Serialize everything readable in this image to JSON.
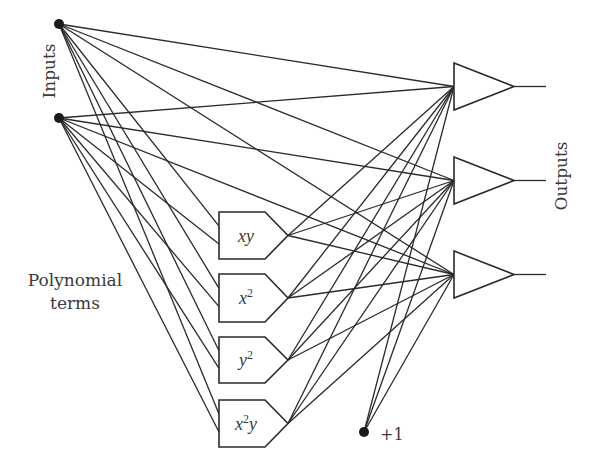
{
  "diagram": {
    "type": "polynomial neural network",
    "labels": {
      "inputs": "Inputs",
      "outputs": "Outputs",
      "polynomial_line1": "Polynomial",
      "polynomial_line2": "terms",
      "bias": "+1"
    },
    "colors": {
      "stroke": "#2a2a2a",
      "node": "#1a1a1a",
      "text": "#3a3a3a",
      "background": "#ffffff"
    },
    "input_nodes": [
      {
        "id": "x",
        "cx": 59,
        "cy": 24
      },
      {
        "id": "y",
        "cx": 59,
        "cy": 118
      }
    ],
    "bias_node": {
      "cx": 364,
      "cy": 432
    },
    "polynomial_terms": [
      {
        "id": "xy",
        "base": "xy",
        "sup": "",
        "tail": "",
        "top": 212,
        "bottom": 259
      },
      {
        "id": "x2",
        "base": "x",
        "sup": "2",
        "tail": "",
        "top": 274,
        "bottom": 322
      },
      {
        "id": "y2",
        "base": "y",
        "sup": "2",
        "tail": "",
        "top": 337,
        "bottom": 383
      },
      {
        "id": "x2y",
        "base": "x",
        "sup": "2",
        "tail": "y",
        "top": 400,
        "bottom": 447
      }
    ],
    "outputs": [
      {
        "id": "out1",
        "top": 63,
        "bottom": 110
      },
      {
        "id": "out2",
        "top": 157,
        "bottom": 204
      },
      {
        "id": "out3",
        "top": 251,
        "bottom": 298
      }
    ]
  }
}
